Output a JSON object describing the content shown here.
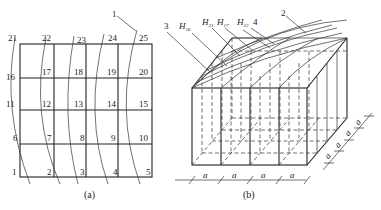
{
  "figure_a": {
    "caption": "(a)",
    "callout": "1",
    "node_labels": {
      "row_top": [
        "21",
        "22",
        "23",
        "24",
        "25"
      ],
      "row_2": [
        "16",
        "17",
        "18",
        "19",
        "20"
      ],
      "row_3": [
        "11",
        "12",
        "13",
        "14",
        "15"
      ],
      "row_4": [
        "6",
        "7",
        "8",
        "9",
        "10"
      ],
      "row_bottom": [
        "1",
        "2",
        "3",
        "4",
        "5"
      ]
    }
  },
  "figure_b": {
    "caption": "(b)",
    "callouts": {
      "c3": "3",
      "c4": "4",
      "c2": "2"
    },
    "height_labels": {
      "h16": {
        "base": "H",
        "sub": "16"
      },
      "h21": {
        "base": "H",
        "sub": "21"
      },
      "h17": {
        "base": "H",
        "sub": "17"
      },
      "h22": {
        "base": "H",
        "sub": "22"
      }
    },
    "dimension_label": "a",
    "front_dimensions": [
      "a",
      "a",
      "a",
      "a"
    ],
    "depth_dimensions": [
      "a",
      "a",
      "a",
      "a"
    ]
  }
}
